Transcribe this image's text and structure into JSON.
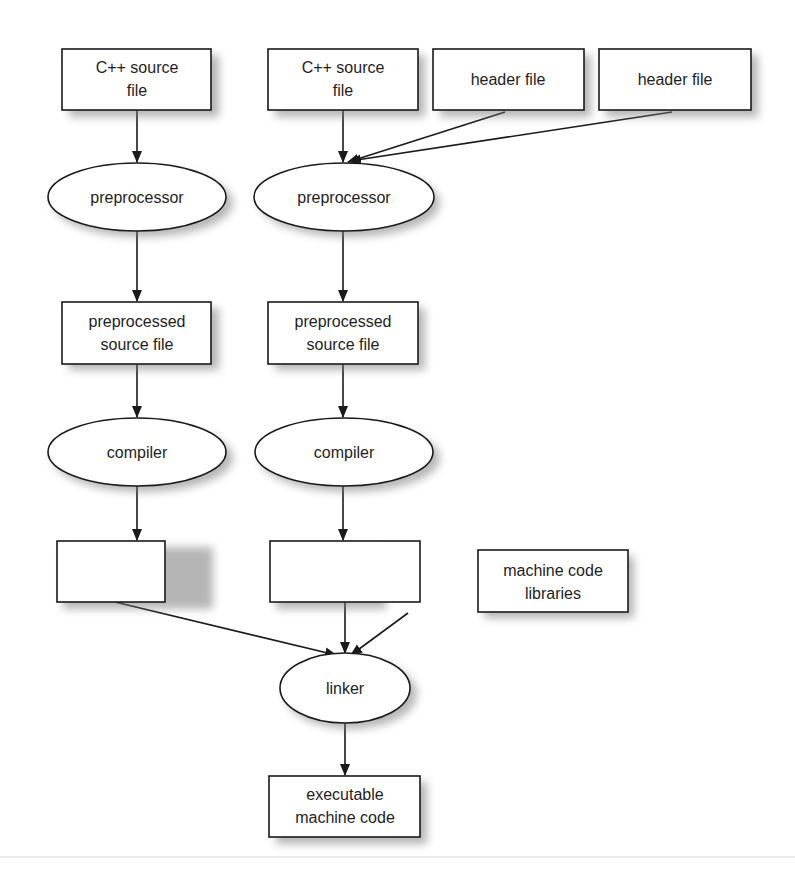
{
  "diagram": {
    "type": "flowchart",
    "topic": "C++ compilation pipeline",
    "nodes": {
      "src1": {
        "shape": "rect",
        "lines": [
          "C++ source",
          "file"
        ]
      },
      "src2": {
        "shape": "rect",
        "lines": [
          "C++ source",
          "file"
        ]
      },
      "hdr1": {
        "shape": "rect",
        "lines": [
          "header file"
        ]
      },
      "hdr2": {
        "shape": "rect",
        "lines": [
          "header file"
        ]
      },
      "pre1": {
        "shape": "ellipse",
        "lines": [
          "preprocessor"
        ]
      },
      "pre2": {
        "shape": "ellipse",
        "lines": [
          "preprocessor"
        ]
      },
      "pps1": {
        "shape": "rect",
        "lines": [
          "preprocessed",
          "source file"
        ]
      },
      "pps2": {
        "shape": "rect",
        "lines": [
          "preprocessed",
          "source file"
        ]
      },
      "cmp1": {
        "shape": "ellipse",
        "lines": [
          "compiler"
        ]
      },
      "cmp2": {
        "shape": "ellipse",
        "lines": [
          "compiler"
        ]
      },
      "mc1": {
        "shape": "rect",
        "lines": [
          "machine code"
        ]
      },
      "mc2": {
        "shape": "rect",
        "lines": [
          "machine code"
        ]
      },
      "lib": {
        "shape": "rect",
        "lines": [
          "machine code",
          "libraries"
        ]
      },
      "lnk": {
        "shape": "ellipse",
        "lines": [
          "linker"
        ]
      },
      "exe": {
        "shape": "rect",
        "lines": [
          "executable",
          "machine code"
        ]
      }
    },
    "edges": [
      {
        "from": "src1",
        "to": "pre1"
      },
      {
        "from": "src2",
        "to": "pre2"
      },
      {
        "from": "hdr1",
        "to": "pre2"
      },
      {
        "from": "hdr2",
        "to": "pre2"
      },
      {
        "from": "pre1",
        "to": "pps1"
      },
      {
        "from": "pre2",
        "to": "pps2"
      },
      {
        "from": "pps1",
        "to": "cmp1"
      },
      {
        "from": "pps2",
        "to": "cmp2"
      },
      {
        "from": "cmp1",
        "to": "mc1"
      },
      {
        "from": "cmp2",
        "to": "mc2"
      },
      {
        "from": "mc1",
        "to": "lnk"
      },
      {
        "from": "mc2",
        "to": "lnk"
      },
      {
        "from": "lib",
        "to": "lnk"
      },
      {
        "from": "lnk",
        "to": "exe"
      }
    ]
  }
}
